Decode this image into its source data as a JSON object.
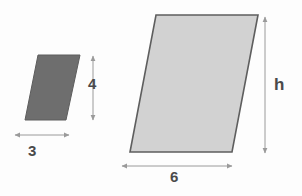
{
  "figure": {
    "type": "geometry-diagram",
    "background_color": "#fdfdfd",
    "shapes": [
      {
        "id": "small-parallelogram",
        "name": "small-parallelogram",
        "fill_color": "#6e6e6e",
        "stroke_color": "#5a5a5a",
        "points": "38,55 80,55 66,120 25,120",
        "dimensions": [
          {
            "id": "small-base",
            "label": "3",
            "orientation": "horizontal"
          },
          {
            "id": "small-height",
            "label": "4",
            "orientation": "vertical"
          }
        ]
      },
      {
        "id": "large-parallelogram",
        "name": "large-parallelogram",
        "fill_color": "#d2d2d2",
        "stroke_color": "#5e5e5e",
        "points": "156,15 258,15 232,152 130,152",
        "dimensions": [
          {
            "id": "large-base",
            "label": "6",
            "orientation": "horizontal"
          },
          {
            "id": "large-height",
            "label": "h",
            "orientation": "vertical"
          }
        ]
      }
    ],
    "labels": {
      "small_height": "4",
      "small_base": "3",
      "large_height": "h",
      "large_base": "6"
    },
    "arrow_color": "#9a9a9a",
    "label_color": "#4a4a4a"
  }
}
